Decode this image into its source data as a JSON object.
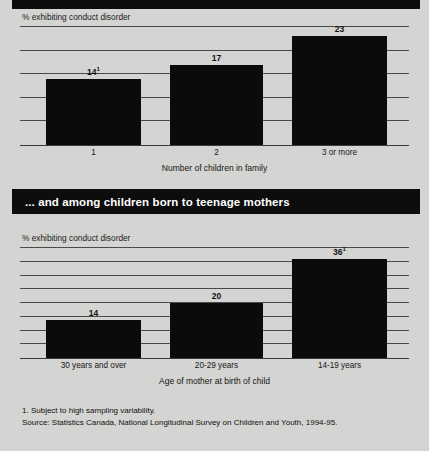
{
  "banners": {
    "top_strip": "",
    "middle_heading": "... and among children born to teenage mothers"
  },
  "footnotes": {
    "note_1": "1. Subject to high sampling variability.",
    "source": "Source: Statistics Canada, National Longitudinal Survey on Children and Youth, 1994-95."
  },
  "chart_data": [
    {
      "id": "conduct-disorder-by-family-size",
      "type": "bar",
      "title": "",
      "ylabel": "% exhibiting conduct disorder",
      "xlabel": "Number of children in family",
      "categories": [
        "1",
        "2",
        "3 or more"
      ],
      "values": [
        14,
        17,
        23
      ],
      "value_labels": [
        "14",
        "17",
        "23"
      ],
      "value_footnote_markers": [
        "1",
        "",
        ""
      ],
      "ylim": [
        0,
        25
      ],
      "gridline_values": [
        5,
        10,
        15,
        20,
        25
      ],
      "grid": true,
      "legend": "none"
    },
    {
      "id": "conduct-disorder-by-mother-age",
      "type": "bar",
      "title": "",
      "ylabel": "% exhibiting conduct disorder",
      "xlabel": "Age of mother at birth of child",
      "categories": [
        "30 years and over",
        "20-29 years",
        "14-19 years"
      ],
      "values": [
        14,
        20,
        36
      ],
      "value_labels": [
        "14",
        "20",
        "36"
      ],
      "value_footnote_markers": [
        "",
        "",
        "1"
      ],
      "ylim": [
        0,
        40
      ],
      "gridline_values": [
        5,
        10,
        15,
        20,
        25,
        30,
        35,
        40
      ],
      "grid": true,
      "legend": "none"
    }
  ],
  "colors": {
    "page_background": "#d4d4d2",
    "bar_fill": "#0b0b0b",
    "banner_background": "#0d0d0d",
    "banner_text": "#ffffff",
    "gridline": "#4a4a4a"
  }
}
